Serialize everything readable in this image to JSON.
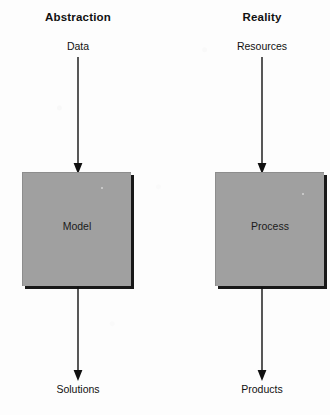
{
  "diagram": {
    "background_color": "#fdfdfd",
    "box_fill_color": "#a0a0a0",
    "box_shadow_color": "#181818",
    "line_color": "#111111",
    "columns": [
      {
        "id": "abstraction",
        "header": "Abstraction",
        "input_label": "Data",
        "box_label": "Model",
        "output_label": "Solutions",
        "arrow_top_name": "arrow-data-to-model",
        "arrow_bottom_name": "arrow-model-to-solutions"
      },
      {
        "id": "reality",
        "header": "Reality",
        "input_label": "Resources",
        "box_label": "Process",
        "output_label": "Products",
        "arrow_top_name": "arrow-resources-to-process",
        "arrow_bottom_name": "arrow-process-to-products"
      }
    ]
  }
}
